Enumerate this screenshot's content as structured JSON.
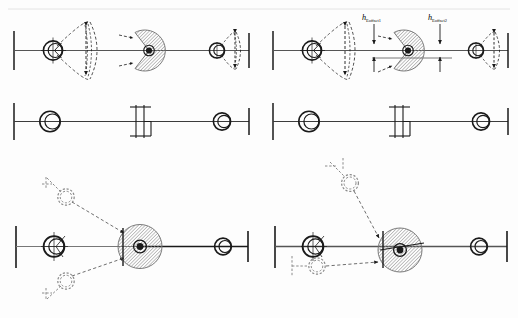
{
  "figure": {
    "background_color": "#fdfdfd",
    "stroke_color": "#1a1a1a",
    "hatch_color": "#8c8c8c",
    "ghost_color": "#9a9a9a",
    "width": 518,
    "height": 318
  },
  "labels": {
    "h_eoffset1": "h",
    "h_eoffset1_sub": "Eoffset1",
    "h_eoffset2": "h",
    "h_eoffset2_sub": "Eoffset2"
  },
  "panels": [
    {
      "id": "top-left",
      "name": "panel-top-left",
      "description": "Shaft with left bearing, lens-shaped swing envelope, hatched eccentric disc with notch, right bearing with swing envelope",
      "elements": [
        "wall-support-left",
        "shaft-line",
        "bearing-left",
        "swing-envelope-left",
        "eccentric-disc",
        "disc-hub",
        "notch-arrows",
        "bearing-right",
        "swing-envelope-right",
        "wall-support-right"
      ]
    },
    {
      "id": "mid-left",
      "name": "panel-mid-left",
      "description": "Plain schematic: wall, shaft, left bearing circle, clutch coupling symbol, right bearing circle",
      "elements": [
        "wall-support-left",
        "shaft-line",
        "bearing-left",
        "clutch-symbol",
        "bearing-right",
        "wall-support-right"
      ]
    },
    {
      "id": "top-right",
      "name": "panel-top-right",
      "description": "Same as top-left with vertical dimension callouts h_Eoffset1 and h_Eoffset2",
      "elements": [
        "wall-support-left",
        "shaft-line",
        "bearing-left",
        "swing-envelope-left",
        "eccentric-disc",
        "disc-hub",
        "dimension-eoffset1",
        "dimension-eoffset2",
        "bearing-right",
        "swing-envelope-right",
        "wall-support-right"
      ]
    },
    {
      "id": "mid-right",
      "name": "panel-mid-right",
      "description": "Plain schematic duplicate of mid-left",
      "elements": [
        "wall-support-left",
        "shaft-line",
        "bearing-left",
        "clutch-symbol",
        "bearing-right",
        "wall-support-right"
      ]
    },
    {
      "id": "bottom-left",
      "name": "panel-bottom-left",
      "description": "Symmetric displaced configuration: two ghost bearing positions above and below connected by dashed links to the hatched disc",
      "elements": [
        "wall-support-left",
        "shaft-line",
        "bearing-left",
        "ghost-bearing-upper",
        "ghost-bearing-lower",
        "dashed-link-upper",
        "dashed-link-lower",
        "eccentric-disc",
        "disc-hub",
        "bearing-right",
        "wall-support-right"
      ]
    },
    {
      "id": "bottom-right",
      "name": "panel-bottom-right",
      "description": "Asymmetric displaced configuration: one ghost bearing high above, one ghost bearing just below the left bearing, dashed links to the hatched disc",
      "elements": [
        "wall-support-left",
        "shaft-line",
        "bearing-left",
        "ghost-bearing-upper",
        "ghost-bearing-lower",
        "dashed-link-upper",
        "dashed-link-lower",
        "eccentric-disc",
        "disc-hub",
        "bearing-right",
        "wall-support-right"
      ]
    }
  ]
}
